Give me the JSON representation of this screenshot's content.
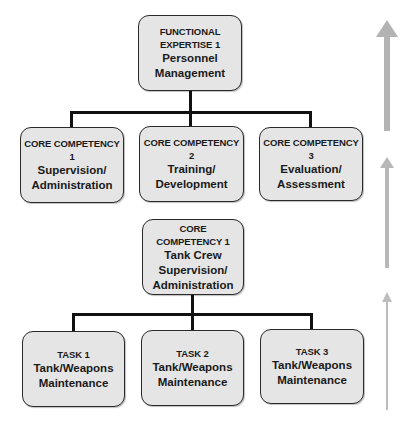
{
  "top": {
    "caption_lines": [
      "FUNCTIONAL",
      "EXPERTISE 1"
    ],
    "title_lines": [
      "Personnel",
      "Management"
    ]
  },
  "level2": [
    {
      "caption": "CORE COMPETENCY 1",
      "title_lines": [
        "Supervision/",
        "Administration"
      ]
    },
    {
      "caption": "CORE COMPETENCY 2",
      "title_lines": [
        "Training/",
        "Development"
      ]
    },
    {
      "caption": "CORE COMPETENCY 3",
      "title_lines": [
        "Evaluation/",
        "Assessment"
      ]
    }
  ],
  "middle": {
    "caption_lines": [
      "CORE",
      "COMPETENCY 1"
    ],
    "title_lines": [
      "Tank Crew",
      "Supervision/",
      "Administration"
    ]
  },
  "tasks": [
    {
      "caption": "TASK 1",
      "title_lines": [
        "Tank/Weapons",
        "Maintenance"
      ]
    },
    {
      "caption": "TASK 2",
      "title_lines": [
        "Tank/Weapons",
        "Maintenance"
      ]
    },
    {
      "caption": "TASK 3",
      "title_lines": [
        "Tank/Weapons",
        "Maintenance"
      ]
    }
  ],
  "colors": {
    "box_fill": "#e5e5e5",
    "box_border": "#2a2a2a",
    "connector": "#111111",
    "arrow": "#b3b3b3"
  },
  "arrows": [
    {
      "name": "arrow-up-large",
      "direction": "up"
    },
    {
      "name": "arrow-up-medium",
      "direction": "up"
    },
    {
      "name": "arrow-up-small",
      "direction": "up"
    }
  ]
}
